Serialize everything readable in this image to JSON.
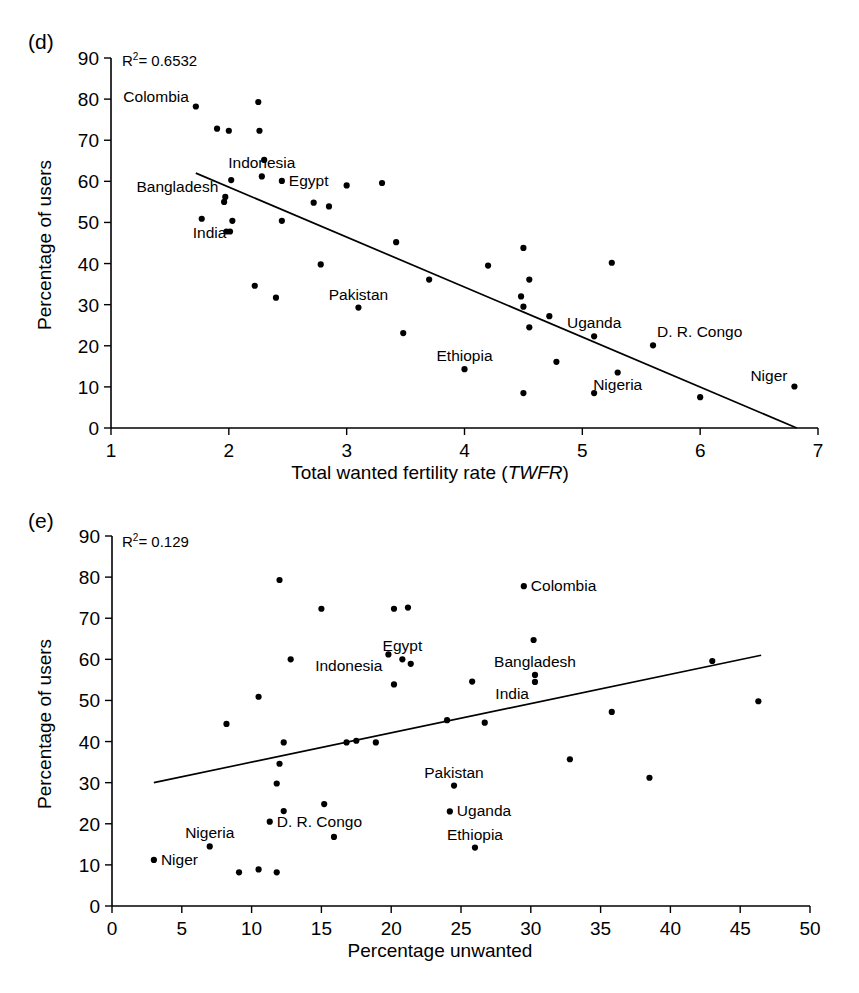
{
  "figure": {
    "background_color": "#ffffff",
    "ink_color": "#000000"
  },
  "panels": [
    {
      "tag": "(d)",
      "r2_prefix": "R",
      "r2_sup": "2",
      "r2_value": "= 0.6532",
      "xlabel_plain_pre": "Total wanted fertility rate (",
      "xlabel_italic": "TWFR",
      "xlabel_plain_post": ")",
      "ylabel": "Percentage of users",
      "chart_data": {
        "type": "scatter",
        "title": "(d)",
        "xlabel": "Total wanted fertility rate (TWFR)",
        "ylabel": "Percentage of users",
        "xlim": [
          1,
          7
        ],
        "ylim": [
          0,
          90
        ],
        "xticks": [
          1,
          2,
          3,
          4,
          5,
          6,
          7
        ],
        "yticks": [
          0,
          10,
          20,
          30,
          40,
          50,
          60,
          70,
          80,
          90
        ],
        "grid": false,
        "legend": null,
        "r_squared": 0.6532,
        "annotation": "R2 = 0.6532",
        "trendline": {
          "x": [
            1.72,
            6.82
          ],
          "y": [
            62.0,
            0.0
          ]
        },
        "points": [
          {
            "x": 1.72,
            "y": 78.2,
            "label": "Colombia",
            "label_pos": "left"
          },
          {
            "x": 2.25,
            "y": 79.3,
            "label": null
          },
          {
            "x": 1.9,
            "y": 72.8,
            "label": null
          },
          {
            "x": 2.0,
            "y": 72.3,
            "label": null
          },
          {
            "x": 2.26,
            "y": 72.3,
            "label": null
          },
          {
            "x": 2.3,
            "y": 65.2,
            "label": null
          },
          {
            "x": 2.28,
            "y": 61.2,
            "label": "Indonesia",
            "label_pos": "above"
          },
          {
            "x": 2.02,
            "y": 60.3,
            "label": null
          },
          {
            "x": 2.45,
            "y": 60.1,
            "label": "Egypt",
            "label_pos": "right"
          },
          {
            "x": 3.0,
            "y": 59.0,
            "label": null
          },
          {
            "x": 3.3,
            "y": 59.6,
            "label": null
          },
          {
            "x": 1.97,
            "y": 56.2,
            "label": "Bangladesh",
            "label_pos": "left"
          },
          {
            "x": 1.96,
            "y": 55.0,
            "label": null
          },
          {
            "x": 2.72,
            "y": 54.8,
            "label": null
          },
          {
            "x": 2.85,
            "y": 53.9,
            "label": null
          },
          {
            "x": 1.77,
            "y": 50.9,
            "label": null
          },
          {
            "x": 2.03,
            "y": 50.4,
            "label": "India",
            "label_pos": "below-left"
          },
          {
            "x": 2.45,
            "y": 50.4,
            "label": null
          },
          {
            "x": 1.98,
            "y": 47.8,
            "label": null
          },
          {
            "x": 3.42,
            "y": 45.2,
            "label": null
          },
          {
            "x": 4.2,
            "y": 39.5,
            "label": null
          },
          {
            "x": 4.5,
            "y": 43.8,
            "label": null
          },
          {
            "x": 5.25,
            "y": 40.2,
            "label": null
          },
          {
            "x": 2.01,
            "y": 47.8,
            "label": null
          },
          {
            "x": 2.78,
            "y": 39.8,
            "label": null
          },
          {
            "x": 2.22,
            "y": 34.6,
            "label": null
          },
          {
            "x": 2.4,
            "y": 31.7,
            "label": null
          },
          {
            "x": 3.7,
            "y": 36.1,
            "label": null
          },
          {
            "x": 4.55,
            "y": 36.1,
            "label": null
          },
          {
            "x": 4.48,
            "y": 32.0,
            "label": null
          },
          {
            "x": 3.1,
            "y": 29.3,
            "label": "Pakistan",
            "label_pos": "above"
          },
          {
            "x": 4.5,
            "y": 29.5,
            "label": null
          },
          {
            "x": 4.72,
            "y": 27.2,
            "label": null
          },
          {
            "x": 3.48,
            "y": 23.1,
            "label": null
          },
          {
            "x": 4.55,
            "y": 24.5,
            "label": null
          },
          {
            "x": 5.1,
            "y": 22.3,
            "label": "Uganda",
            "label_pos": "above"
          },
          {
            "x": 5.6,
            "y": 20.1,
            "label": "D. R. Congo",
            "label_pos": "above-right"
          },
          {
            "x": 4.0,
            "y": 14.3,
            "label": "Ethiopia",
            "label_pos": "above"
          },
          {
            "x": 4.78,
            "y": 16.1,
            "label": null
          },
          {
            "x": 5.3,
            "y": 13.5,
            "label": "Nigeria",
            "label_pos": "below"
          },
          {
            "x": 4.5,
            "y": 8.5,
            "label": null
          },
          {
            "x": 5.1,
            "y": 8.5,
            "label": null
          },
          {
            "x": 6.0,
            "y": 7.5,
            "label": null
          },
          {
            "x": 6.8,
            "y": 10.1,
            "label": "Niger",
            "label_pos": "left"
          }
        ]
      }
    },
    {
      "tag": "(e)",
      "r2_prefix": "R",
      "r2_sup": "2",
      "r2_value": "= 0.129",
      "xlabel_plain_pre": "Percentage unwanted",
      "xlabel_italic": "",
      "xlabel_plain_post": "",
      "ylabel": "Percentage of users",
      "chart_data": {
        "type": "scatter",
        "title": "(e)",
        "xlabel": "Percentage unwanted",
        "ylabel": "Percentage of users",
        "xlim": [
          0,
          50
        ],
        "ylim": [
          0,
          90
        ],
        "xticks": [
          0,
          5,
          10,
          15,
          20,
          25,
          30,
          35,
          40,
          45,
          50
        ],
        "yticks": [
          0,
          10,
          20,
          30,
          40,
          50,
          60,
          70,
          80,
          90
        ],
        "grid": false,
        "legend": null,
        "r_squared": 0.129,
        "annotation": "R2 = 0.129",
        "trendline": {
          "x": [
            3.0,
            46.5
          ],
          "y": [
            30.0,
            61.0
          ]
        },
        "points": [
          {
            "x": 12.0,
            "y": 79.3,
            "label": null
          },
          {
            "x": 29.5,
            "y": 77.8,
            "label": "Colombia",
            "label_pos": "right"
          },
          {
            "x": 15.0,
            "y": 72.3,
            "label": null
          },
          {
            "x": 20.2,
            "y": 72.3,
            "label": null
          },
          {
            "x": 21.2,
            "y": 72.6,
            "label": null
          },
          {
            "x": 30.2,
            "y": 64.7,
            "label": null
          },
          {
            "x": 12.8,
            "y": 60.0,
            "label": null
          },
          {
            "x": 19.8,
            "y": 61.2,
            "label": "Indonesia",
            "label_pos": "below-left"
          },
          {
            "x": 20.8,
            "y": 60.0,
            "label": "Egypt",
            "label_pos": "above"
          },
          {
            "x": 21.4,
            "y": 58.9,
            "label": null
          },
          {
            "x": 43.0,
            "y": 59.6,
            "label": null
          },
          {
            "x": 30.3,
            "y": 56.2,
            "label": "Bangladesh",
            "label_pos": "above"
          },
          {
            "x": 25.8,
            "y": 54.6,
            "label": null
          },
          {
            "x": 20.2,
            "y": 53.9,
            "label": null
          },
          {
            "x": 30.3,
            "y": 54.5,
            "label": "India",
            "label_pos": "below-left"
          },
          {
            "x": 35.8,
            "y": 47.2,
            "label": null
          },
          {
            "x": 46.3,
            "y": 49.8,
            "label": null
          },
          {
            "x": 10.5,
            "y": 50.9,
            "label": null
          },
          {
            "x": 8.2,
            "y": 44.3,
            "label": null
          },
          {
            "x": 24.0,
            "y": 45.2,
            "label": null
          },
          {
            "x": 26.7,
            "y": 44.6,
            "label": null
          },
          {
            "x": 12.3,
            "y": 39.8,
            "label": null
          },
          {
            "x": 17.5,
            "y": 40.2,
            "label": null
          },
          {
            "x": 16.8,
            "y": 39.8,
            "label": null
          },
          {
            "x": 18.9,
            "y": 39.8,
            "label": null
          },
          {
            "x": 32.8,
            "y": 35.7,
            "label": null
          },
          {
            "x": 38.5,
            "y": 31.2,
            "label": null
          },
          {
            "x": 12.0,
            "y": 34.6,
            "label": null
          },
          {
            "x": 24.5,
            "y": 29.3,
            "label": "Pakistan",
            "label_pos": "above"
          },
          {
            "x": 11.8,
            "y": 29.8,
            "label": null
          },
          {
            "x": 15.2,
            "y": 24.8,
            "label": null
          },
          {
            "x": 12.3,
            "y": 23.1,
            "label": null
          },
          {
            "x": 24.2,
            "y": 23.0,
            "label": "Uganda",
            "label_pos": "right"
          },
          {
            "x": 11.3,
            "y": 20.5,
            "label": "D. R. Congo",
            "label_pos": "right"
          },
          {
            "x": 15.9,
            "y": 16.8,
            "label": null
          },
          {
            "x": 26.0,
            "y": 14.2,
            "label": "Ethiopia",
            "label_pos": "above"
          },
          {
            "x": 7.0,
            "y": 14.5,
            "label": "Nigeria",
            "label_pos": "above"
          },
          {
            "x": 3.0,
            "y": 11.2,
            "label": "Niger",
            "label_pos": "right"
          },
          {
            "x": 9.1,
            "y": 8.2,
            "label": null
          },
          {
            "x": 10.5,
            "y": 8.9,
            "label": null
          },
          {
            "x": 11.8,
            "y": 8.2,
            "label": null
          }
        ]
      }
    }
  ]
}
